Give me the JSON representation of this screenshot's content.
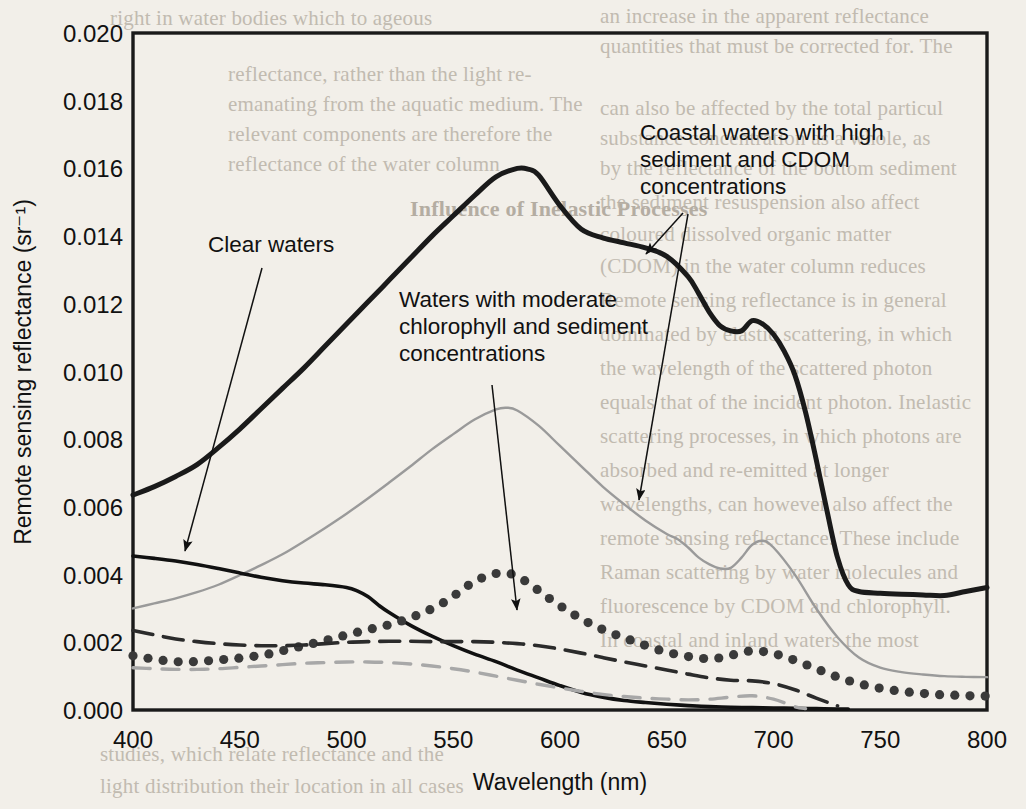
{
  "page": {
    "background_color": "#f2efe9",
    "bleed_text": [
      {
        "text": "right in water bodies which to ageous",
        "x": 110,
        "y": 6,
        "size": 21,
        "style": "normal"
      },
      {
        "text": "an increase in the apparent reflectance",
        "x": 600,
        "y": 4,
        "size": 21,
        "style": "normal"
      },
      {
        "text": "quantities that must be corrected for. The",
        "x": 600,
        "y": 34,
        "size": 21,
        "style": "normal"
      },
      {
        "text": "reflectance, rather than the light re-",
        "x": 228,
        "y": 62,
        "size": 21,
        "style": "normal"
      },
      {
        "text": "emanating from the aquatic medium. The",
        "x": 228,
        "y": 92,
        "size": 21,
        "style": "normal"
      },
      {
        "text": "can also be affected by the total particul",
        "x": 600,
        "y": 96,
        "size": 21,
        "style": "normal"
      },
      {
        "text": "relevant components are therefore the",
        "x": 228,
        "y": 122,
        "size": 21,
        "style": "normal"
      },
      {
        "text": "reflectance of the water column",
        "x": 228,
        "y": 152,
        "size": 21,
        "style": "normal"
      },
      {
        "text": "substance concentration as a whole, as",
        "x": 600,
        "y": 126,
        "size": 21,
        "style": "normal"
      },
      {
        "text": "by the reflectance of the bottom sediment",
        "x": 600,
        "y": 156,
        "size": 21,
        "style": "normal"
      },
      {
        "text": "Influence of Inelastic Processes",
        "x": 410,
        "y": 196,
        "size": 22,
        "style": "bold"
      },
      {
        "text": "the sediment resuspension also affect",
        "x": 600,
        "y": 190,
        "size": 21,
        "style": "normal"
      },
      {
        "text": "coloured dissolved organic matter",
        "x": 600,
        "y": 222,
        "size": 21,
        "style": "normal"
      },
      {
        "text": "(CDOM)  in  the  water  column  reduces",
        "x": 600,
        "y": 254,
        "size": 21,
        "style": "normal"
      },
      {
        "text": "Remote sensing reflectance is in general",
        "x": 600,
        "y": 288,
        "size": 21,
        "style": "normal"
      },
      {
        "text": "dominated by elastic scattering, in which",
        "x": 600,
        "y": 322,
        "size": 21,
        "style": "normal"
      },
      {
        "text": "the wavelength of the scattered photon",
        "x": 600,
        "y": 356,
        "size": 21,
        "style": "normal"
      },
      {
        "text": "equals that of the incident photon. Inelastic",
        "x": 600,
        "y": 390,
        "size": 21,
        "style": "normal"
      },
      {
        "text": "scattering processes, in which photons are",
        "x": 600,
        "y": 424,
        "size": 21,
        "style": "normal"
      },
      {
        "text": "absorbed and re-emitted at longer",
        "x": 600,
        "y": 458,
        "size": 21,
        "style": "normal"
      },
      {
        "text": "wavelengths, can however also affect the",
        "x": 600,
        "y": 492,
        "size": 21,
        "style": "normal"
      },
      {
        "text": "remote sensing reflectance. These include",
        "x": 600,
        "y": 526,
        "size": 21,
        "style": "normal"
      },
      {
        "text": "Raman scattering by water molecules and",
        "x": 600,
        "y": 560,
        "size": 21,
        "style": "normal"
      },
      {
        "text": "fluorescence by CDOM and chlorophyll.",
        "x": 600,
        "y": 594,
        "size": 21,
        "style": "normal"
      },
      {
        "text": "In coastal and inland waters the most",
        "x": 600,
        "y": 628,
        "size": 21,
        "style": "normal"
      },
      {
        "text": "studies, which relate reflectance and the",
        "x": 100,
        "y": 742,
        "size": 21,
        "style": "normal"
      },
      {
        "text": "light distribution their location in all cases",
        "x": 100,
        "y": 774,
        "size": 21,
        "style": "normal"
      }
    ]
  },
  "chart_data": {
    "type": "line",
    "title": "",
    "xlabel": "Wavelength (nm)",
    "ylabel": "Remote sensing reflectance (sr⁻¹)",
    "xlim": [
      400,
      800
    ],
    "ylim": [
      0.0,
      0.02
    ],
    "xticks": [
      400,
      450,
      500,
      550,
      600,
      650,
      700,
      750,
      800
    ],
    "xtick_labels": [
      "400",
      "450",
      "500",
      "550",
      "600",
      "650",
      "700",
      "750",
      "800"
    ],
    "yticks": [
      0.0,
      0.002,
      0.004,
      0.006,
      0.008,
      0.01,
      0.012,
      0.014,
      0.016,
      0.018,
      0.02
    ],
    "ytick_labels": [
      "0.000",
      "0.002",
      "0.004",
      "0.006",
      "0.008",
      "0.010",
      "0.012",
      "0.014",
      "0.016",
      "0.018",
      "0.020"
    ],
    "grid": false,
    "legend": "none (annotated with leader lines)",
    "series": [
      {
        "name": "Coastal waters with high sediment and CDOM concentrations",
        "style": "solid-thick",
        "color": "#1a1a1a",
        "width": 5,
        "x": [
          400,
          410,
          420,
          430,
          440,
          450,
          460,
          470,
          480,
          490,
          500,
          510,
          520,
          530,
          540,
          550,
          560,
          570,
          580,
          585,
          590,
          600,
          610,
          620,
          630,
          640,
          650,
          660,
          665,
          670,
          675,
          680,
          685,
          690,
          695,
          700,
          705,
          710,
          715,
          720,
          725,
          730,
          735,
          740,
          750,
          760,
          770,
          780,
          790,
          800
        ],
        "y": [
          0.00635,
          0.0066,
          0.0069,
          0.00725,
          0.00775,
          0.0083,
          0.0089,
          0.0095,
          0.0101,
          0.01075,
          0.0114,
          0.01205,
          0.0127,
          0.01335,
          0.014,
          0.0146,
          0.0152,
          0.01575,
          0.016,
          0.01598,
          0.0158,
          0.0149,
          0.0142,
          0.01395,
          0.0138,
          0.01365,
          0.0134,
          0.0128,
          0.0123,
          0.01175,
          0.01135,
          0.0112,
          0.0112,
          0.0115,
          0.0114,
          0.0111,
          0.0106,
          0.0099,
          0.0088,
          0.0074,
          0.0059,
          0.0045,
          0.0037,
          0.0035,
          0.00345,
          0.00342,
          0.0034,
          0.00338,
          0.0035,
          0.00362
        ]
      },
      {
        "name": "Waters with moderate chlorophyll and sediment concentrations",
        "style": "solid-thin-gray",
        "color": "#9a9a9a",
        "width": 2.4,
        "x": [
          400,
          410,
          420,
          430,
          440,
          450,
          460,
          470,
          480,
          490,
          500,
          510,
          520,
          530,
          540,
          550,
          560,
          570,
          575,
          580,
          590,
          600,
          610,
          620,
          630,
          640,
          650,
          655,
          660,
          665,
          670,
          675,
          680,
          685,
          690,
          695,
          700,
          710,
          720,
          730,
          740,
          750,
          760,
          770,
          780,
          790,
          800
        ],
        "y": [
          0.003,
          0.00315,
          0.0033,
          0.00348,
          0.0037,
          0.00398,
          0.00428,
          0.0046,
          0.00498,
          0.00538,
          0.0058,
          0.00625,
          0.00672,
          0.0072,
          0.0077,
          0.00815,
          0.00858,
          0.00888,
          0.00893,
          0.00885,
          0.0084,
          0.0078,
          0.0072,
          0.0066,
          0.00608,
          0.0056,
          0.0052,
          0.00505,
          0.0048,
          0.0045,
          0.0043,
          0.00418,
          0.0042,
          0.0045,
          0.00488,
          0.005,
          0.0048,
          0.004,
          0.003,
          0.00215,
          0.00155,
          0.00125,
          0.00112,
          0.00105,
          0.001,
          0.00098,
          0.00097
        ]
      },
      {
        "name": "Clear waters",
        "style": "solid-medium-black",
        "color": "#111111",
        "width": 3.6,
        "x": [
          400,
          410,
          420,
          430,
          440,
          450,
          460,
          470,
          480,
          490,
          500,
          505,
          510,
          515,
          520,
          530,
          540,
          550,
          560,
          570,
          580,
          590,
          600,
          610,
          620,
          630,
          640,
          650,
          660,
          670,
          680,
          690,
          700,
          710,
          720,
          730,
          735
        ],
        "y": [
          0.00455,
          0.00448,
          0.0044,
          0.0043,
          0.00418,
          0.00405,
          0.00392,
          0.00382,
          0.00375,
          0.0037,
          0.00362,
          0.00352,
          0.00335,
          0.0031,
          0.00288,
          0.0025,
          0.00218,
          0.0019,
          0.00165,
          0.00143,
          0.00118,
          0.00095,
          0.00072,
          0.00052,
          0.00038,
          0.00028,
          0.00022,
          0.00017,
          0.00013,
          0.0001,
          8e-05,
          7e-05,
          6e-05,
          5e-05,
          4e-05,
          3e-05,
          3e-05
        ]
      },
      {
        "name": "Dotted series (moderate chlorophyll / sediment)",
        "style": "dotted-thick",
        "color": "#3a3a3a",
        "width": 7,
        "x": [
          400,
          408,
          416,
          424,
          432,
          440,
          448,
          456,
          464,
          472,
          480,
          488,
          496,
          504,
          512,
          520,
          528,
          536,
          544,
          552,
          560,
          568,
          574,
          580,
          588,
          596,
          604,
          612,
          620,
          628,
          636,
          644,
          652,
          660,
          668,
          676,
          684,
          690,
          696,
          704,
          712,
          720,
          728,
          736,
          744,
          752,
          760,
          768,
          776,
          784,
          792,
          800
        ],
        "y": [
          0.0016,
          0.00152,
          0.00145,
          0.00142,
          0.00144,
          0.00148,
          0.00152,
          0.00158,
          0.00166,
          0.00178,
          0.0019,
          0.00202,
          0.00215,
          0.00228,
          0.0024,
          0.00252,
          0.00268,
          0.00288,
          0.00312,
          0.00345,
          0.0038,
          0.004,
          0.00405,
          0.00395,
          0.00362,
          0.00325,
          0.00292,
          0.00262,
          0.00238,
          0.00218,
          0.002,
          0.00182,
          0.00168,
          0.00158,
          0.00152,
          0.00155,
          0.00168,
          0.00175,
          0.00172,
          0.0016,
          0.00142,
          0.00122,
          0.00102,
          0.00085,
          0.00072,
          0.00062,
          0.00055,
          0.0005,
          0.00046,
          0.00044,
          0.00042,
          0.00041
        ]
      },
      {
        "name": "Dashed dark series",
        "style": "dashed-dark",
        "color": "#2b2b2b",
        "width": 3.6,
        "x": [
          400,
          410,
          420,
          430,
          440,
          450,
          460,
          470,
          480,
          490,
          500,
          510,
          520,
          530,
          540,
          550,
          560,
          570,
          580,
          590,
          600,
          610,
          620,
          630,
          640,
          650,
          660,
          670,
          680,
          690,
          700,
          710,
          720,
          730
        ],
        "y": [
          0.00235,
          0.00222,
          0.0021,
          0.00202,
          0.00196,
          0.00192,
          0.0019,
          0.0019,
          0.00192,
          0.00196,
          0.002,
          0.00202,
          0.00203,
          0.00203,
          0.00202,
          0.00202,
          0.00202,
          0.002,
          0.00196,
          0.0019,
          0.0018,
          0.00168,
          0.00155,
          0.00142,
          0.0013,
          0.00118,
          0.00106,
          0.00095,
          0.00088,
          0.00086,
          0.00078,
          0.0006,
          0.00035,
          0.00012
        ]
      },
      {
        "name": "Dashed light-gray series",
        "style": "dashed-gray",
        "color": "#a8a8a8",
        "width": 3.4,
        "x": [
          400,
          410,
          420,
          430,
          440,
          450,
          460,
          470,
          480,
          490,
          500,
          510,
          520,
          530,
          540,
          550,
          560,
          570,
          580,
          590,
          600,
          610,
          620,
          630,
          640,
          650,
          660,
          670,
          680,
          690,
          700,
          710,
          715
        ],
        "y": [
          0.00125,
          0.00122,
          0.0012,
          0.0012,
          0.00122,
          0.00126,
          0.0013,
          0.00134,
          0.00138,
          0.0014,
          0.00142,
          0.00142,
          0.0014,
          0.00136,
          0.0013,
          0.00122,
          0.00112,
          0.001,
          0.00088,
          0.00076,
          0.00065,
          0.00055,
          0.00046,
          0.0004,
          0.00035,
          0.00032,
          0.0003,
          0.00032,
          0.00038,
          0.00042,
          0.00032,
          0.0001,
          4e-05
        ]
      }
    ],
    "annotations": [
      {
        "id": "clear-waters",
        "text": "Clear waters",
        "lines": [
          "Clear waters"
        ],
        "text_x": 208,
        "text_y": 252,
        "leader": {
          "x1": 262,
          "y1": 268,
          "x2": 185,
          "y2": 551
        }
      },
      {
        "id": "moderate",
        "text": "Waters with moderate chlorophyll and sediment concentrations",
        "lines": [
          "Waters with moderate",
          "chlorophyll and sediment",
          "concentrations"
        ],
        "text_x": 399,
        "text_y": 307,
        "leader": {
          "x1": 492,
          "y1": 385,
          "x2": 517,
          "y2": 610
        }
      },
      {
        "id": "coastal",
        "text": "Coastal waters with high sediment and CDOM concentrations",
        "lines": [
          "Coastal waters with high",
          "sediment and CDOM",
          "concentrations"
        ],
        "text_x": 640,
        "text_y": 140,
        "leader_a": {
          "x1": 683,
          "y1": 213,
          "x2": 646,
          "y2": 254
        },
        "leader_b": {
          "x1": 688,
          "y1": 214,
          "x2": 639,
          "y2": 500
        }
      }
    ]
  }
}
